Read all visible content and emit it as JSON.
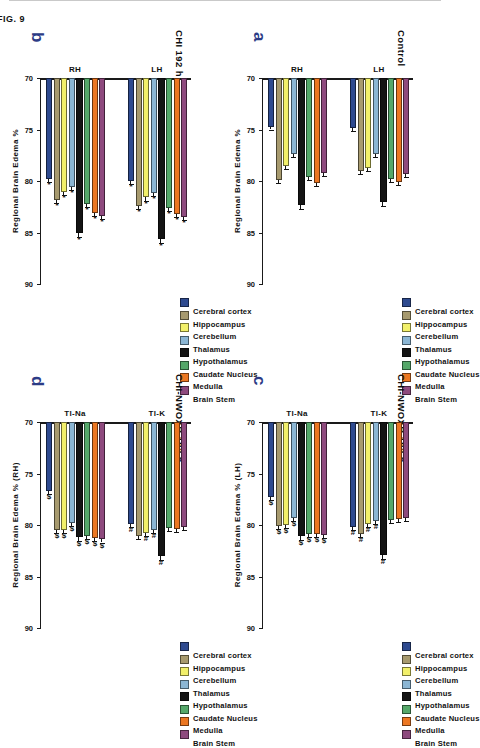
{
  "figure": {
    "caption": "FIG. 9",
    "legend_title": "",
    "series": [
      {
        "label": "Cerebral cortex",
        "color": "#2e4a8f"
      },
      {
        "label": "Hippocampus",
        "color": "#a79a6e"
      },
      {
        "label": "Cerebellum",
        "color": "#f2f06a"
      },
      {
        "label": "Thalamus",
        "color": "#8bb6d4"
      },
      {
        "label": "Hypothalamus",
        "color": "#141414"
      },
      {
        "label": "Caudate Nucleus",
        "color": "#55a86a"
      },
      {
        "label": "Medulla",
        "color": "#ec7722"
      },
      {
        "label": "Brain Stem",
        "color": "#8e4a7e"
      }
    ]
  },
  "panels": [
    {
      "id": "a",
      "label": "a",
      "title": "Control",
      "ylabel": "Regional Brain Edema %",
      "yticks": [
        "90",
        "85",
        "80",
        "75",
        "70"
      ],
      "ylim": [
        70,
        90
      ],
      "groups": [
        "RH",
        "LH"
      ]
    },
    {
      "id": "b",
      "label": "b",
      "title": "CHI 192 h",
      "ylabel": "Regional Brain Edema %",
      "yticks": [
        "90",
        "85",
        "80",
        "75",
        "70"
      ],
      "ylim": [
        70,
        90
      ],
      "groups": [
        "RH",
        "LH"
      ]
    },
    {
      "id": "c",
      "label": "c",
      "title": "CHI-NWOXR 192 h",
      "ylabel": "Regional Brain Edema % (LH)",
      "yticks": [
        "90",
        "85",
        "80",
        "75",
        "70"
      ],
      "ylim": [
        70,
        90
      ],
      "groups": [
        "Tl-Na",
        "Tl-K"
      ]
    },
    {
      "id": "d",
      "label": "d",
      "title": "CHI-NWOXR 192 h",
      "ylabel": "Regional Brain Edema % (RH)",
      "yticks": [
        "90",
        "85",
        "80",
        "75",
        "70"
      ],
      "ylim": [
        70,
        90
      ],
      "groups": [
        "Tl-Na",
        "Tl-K"
      ]
    }
  ],
  "chart_data": [
    {
      "panel": "a",
      "type": "bar",
      "title": "Control",
      "xlabel": "",
      "ylabel": "Regional Brain Edema %",
      "ylim": [
        70,
        90
      ],
      "categories": [
        "RH",
        "LH"
      ],
      "grid": false,
      "legend": "top-right",
      "series": [
        {
          "name": "Cerebral cortex",
          "values": [
            74.8,
            74.9
          ],
          "errors": [
            0.2,
            0.2
          ],
          "sig": [
            "",
            ""
          ]
        },
        {
          "name": "Hippocampus",
          "values": [
            79.9,
            79.0
          ],
          "errors": [
            0.3,
            0.3
          ],
          "sig": [
            "",
            ""
          ]
        },
        {
          "name": "Cerebellum",
          "values": [
            78.5,
            78.7
          ],
          "errors": [
            0.3,
            0.3
          ],
          "sig": [
            "",
            ""
          ]
        },
        {
          "name": "Thalamus",
          "values": [
            77.4,
            77.4
          ],
          "errors": [
            0.3,
            0.3
          ],
          "sig": [
            "",
            ""
          ]
        },
        {
          "name": "Hypothalamus",
          "values": [
            82.3,
            82.0
          ],
          "errors": [
            0.4,
            0.4
          ],
          "sig": [
            "",
            ""
          ]
        },
        {
          "name": "Caudate Nucleus",
          "values": [
            79.6,
            79.8
          ],
          "errors": [
            0.3,
            0.3
          ],
          "sig": [
            "",
            ""
          ]
        },
        {
          "name": "Medulla",
          "values": [
            80.2,
            80.1
          ],
          "errors": [
            0.3,
            0.3
          ],
          "sig": [
            "",
            ""
          ]
        },
        {
          "name": "Brain Stem",
          "values": [
            79.2,
            79.3
          ],
          "errors": [
            0.3,
            0.3
          ],
          "sig": [
            "",
            ""
          ]
        }
      ]
    },
    {
      "panel": "b",
      "type": "bar",
      "title": "CHI 192 h",
      "xlabel": "",
      "ylabel": "Regional Brain Edema %",
      "ylim": [
        70,
        90
      ],
      "categories": [
        "RH",
        "LH"
      ],
      "grid": false,
      "legend": "top-right",
      "series": [
        {
          "name": "Cerebral cortex",
          "values": [
            79.8,
            80.0
          ],
          "errors": [
            0.3,
            0.3
          ],
          "sig": [
            "*",
            "*"
          ]
        },
        {
          "name": "Hippocampus",
          "values": [
            81.8,
            82.4
          ],
          "errors": [
            0.3,
            0.3
          ],
          "sig": [
            "*",
            "*"
          ]
        },
        {
          "name": "Cerebellum",
          "values": [
            81.1,
            81.6
          ],
          "errors": [
            0.3,
            0.3
          ],
          "sig": [
            "*",
            "*"
          ]
        },
        {
          "name": "Thalamus",
          "values": [
            80.6,
            81.2
          ],
          "errors": [
            0.3,
            0.3
          ],
          "sig": [
            "*",
            "*"
          ]
        },
        {
          "name": "Hypothalamus",
          "values": [
            85.0,
            85.6
          ],
          "errors": [
            0.4,
            0.4
          ],
          "sig": [
            "*",
            "*"
          ]
        },
        {
          "name": "Caudate Nucleus",
          "values": [
            82.2,
            82.6
          ],
          "errors": [
            0.3,
            0.3
          ],
          "sig": [
            "*",
            "*"
          ]
        },
        {
          "name": "Medulla",
          "values": [
            83.1,
            83.2
          ],
          "errors": [
            0.3,
            0.3
          ],
          "sig": [
            "*",
            "*"
          ]
        },
        {
          "name": "Brain Stem",
          "values": [
            83.4,
            83.5
          ],
          "errors": [
            0.3,
            0.3
          ],
          "sig": [
            "*",
            "*"
          ]
        }
      ]
    },
    {
      "panel": "c",
      "type": "bar",
      "title": "CHI-NWOXR 192 h",
      "xlabel": "",
      "ylabel": "Regional Brain Edema % (LH)",
      "ylim": [
        70,
        90
      ],
      "categories": [
        "Tl-Na",
        "Tl-K"
      ],
      "grid": false,
      "legend": "top-right",
      "series": [
        {
          "name": "Cerebral cortex",
          "values": [
            77.3,
            80.2
          ],
          "errors": [
            0.3,
            0.3
          ],
          "sig": [
            "$",
            "#"
          ]
        },
        {
          "name": "Hippocampus",
          "values": [
            80.1,
            80.9
          ],
          "errors": [
            0.3,
            0.3
          ],
          "sig": [
            "$",
            "#"
          ]
        },
        {
          "name": "Cerebellum",
          "values": [
            80.0,
            79.9
          ],
          "errors": [
            0.3,
            0.3
          ],
          "sig": [
            "$",
            "#"
          ]
        },
        {
          "name": "Thalamus",
          "values": [
            79.3,
            79.6
          ],
          "errors": [
            0.3,
            0.3
          ],
          "sig": [
            "$",
            "#"
          ]
        },
        {
          "name": "Hypothalamus",
          "values": [
            81.1,
            82.9
          ],
          "errors": [
            0.4,
            0.4
          ],
          "sig": [
            "$",
            "#"
          ]
        },
        {
          "name": "Caudate Nucleus",
          "values": [
            80.9,
            79.5
          ],
          "errors": [
            0.3,
            0.3
          ],
          "sig": [
            "$",
            ""
          ]
        },
        {
          "name": "Medulla",
          "values": [
            80.9,
            79.4
          ],
          "errors": [
            0.3,
            0.3
          ],
          "sig": [
            "$",
            ""
          ]
        },
        {
          "name": "Brain Stem",
          "values": [
            81.0,
            79.3
          ],
          "errors": [
            0.3,
            0.3
          ],
          "sig": [
            "$",
            ""
          ]
        }
      ]
    },
    {
      "panel": "d",
      "type": "bar",
      "title": "CHI-NWOXR 192 h",
      "xlabel": "",
      "ylabel": "Regional Brain Edema % (RH)",
      "ylim": [
        70,
        90
      ],
      "categories": [
        "Tl-Na",
        "Tl-K"
      ],
      "grid": false,
      "legend": "top-right",
      "series": [
        {
          "name": "Cerebral cortex",
          "values": [
            76.7,
            79.9
          ],
          "errors": [
            0.3,
            0.3
          ],
          "sig": [
            "$",
            "#"
          ]
        },
        {
          "name": "Hippocampus",
          "values": [
            80.5,
            81.1
          ],
          "errors": [
            0.3,
            0.3
          ],
          "sig": [
            "$",
            ""
          ]
        },
        {
          "name": "Cerebellum",
          "values": [
            80.5,
            80.8
          ],
          "errors": [
            0.3,
            0.3
          ],
          "sig": [
            "$",
            "#"
          ]
        },
        {
          "name": "Thalamus",
          "values": [
            79.8,
            80.5
          ],
          "errors": [
            0.3,
            0.3
          ],
          "sig": [
            "$",
            "#"
          ]
        },
        {
          "name": "Hypothalamus",
          "values": [
            81.2,
            83.0
          ],
          "errors": [
            0.4,
            0.4
          ],
          "sig": [
            "$",
            "#"
          ]
        },
        {
          "name": "Caudate Nucleus",
          "values": [
            81.1,
            80.3
          ],
          "errors": [
            0.3,
            0.3
          ],
          "sig": [
            "$",
            ""
          ]
        },
        {
          "name": "Medulla",
          "values": [
            81.3,
            80.4
          ],
          "errors": [
            0.3,
            0.3
          ],
          "sig": [
            "$",
            ""
          ]
        },
        {
          "name": "Brain Stem",
          "values": [
            81.4,
            80.2
          ],
          "errors": [
            0.3,
            0.3
          ],
          "sig": [
            "$",
            ""
          ]
        }
      ]
    }
  ]
}
